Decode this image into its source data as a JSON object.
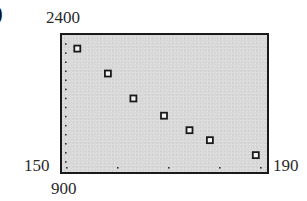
{
  "panel_label": ")",
  "window": {
    "xmin": "150",
    "xmax": "190",
    "ymin": "900",
    "ymax": "2400"
  },
  "colors": {
    "background": "#d9d9d9",
    "frame": "#1a1a1a",
    "marker": "#1a1a1a"
  },
  "chart_data": {
    "type": "scatter",
    "title": "",
    "xlabel": "",
    "ylabel": "",
    "xlim": [
      150,
      190
    ],
    "ylim": [
      900,
      2400
    ],
    "grid": false,
    "legend": null,
    "x_tick_spacing": 10,
    "y_tick_spacing": 100,
    "marker": "hollow-square",
    "series": [
      {
        "name": "data",
        "points": [
          {
            "x": 153,
            "y": 2250
          },
          {
            "x": 159,
            "y": 1975
          },
          {
            "x": 164,
            "y": 1700
          },
          {
            "x": 170,
            "y": 1510
          },
          {
            "x": 175,
            "y": 1350
          },
          {
            "x": 179,
            "y": 1240
          },
          {
            "x": 188,
            "y": 1075
          }
        ]
      }
    ]
  }
}
